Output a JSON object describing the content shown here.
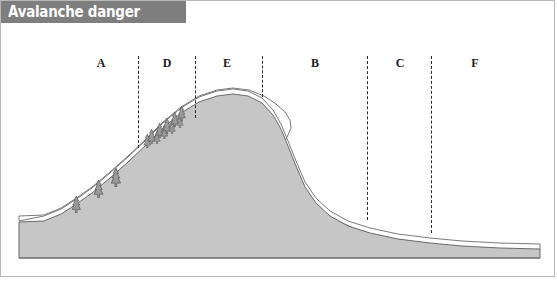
{
  "figure": {
    "title": "Avalanche danger",
    "title_bar_color": "#7e7e7e",
    "title_text_color": "#ffffff",
    "background_color": "#ffffff",
    "frame_color": "#b8b8b8"
  },
  "terrain": {
    "rock_fill_color": "#c6c6c6",
    "rock_outline_color": "#6b6b6b",
    "snow_fill_color": "#ffffff",
    "snow_outline_color": "#7a7a7a",
    "description": "Cross-section of a mountain ridge with a snow cover layer and a cornice on the lee slope"
  },
  "zones": [
    {
      "label": "A",
      "x": 101,
      "y": 57
    },
    {
      "label": "D",
      "x": 167,
      "y": 57
    },
    {
      "label": "E",
      "x": 227,
      "y": 57
    },
    {
      "label": "B",
      "x": 315,
      "y": 57
    },
    {
      "label": "C",
      "x": 400,
      "y": 57
    },
    {
      "label": "F",
      "x": 475,
      "y": 57
    }
  ],
  "dividers": [
    {
      "x": 138,
      "top": 56,
      "bottom": 148
    },
    {
      "x": 195,
      "top": 56,
      "bottom": 118
    },
    {
      "x": 262,
      "top": 56,
      "bottom": 97
    },
    {
      "x": 367,
      "top": 56,
      "bottom": 220
    },
    {
      "x": 431,
      "top": 56,
      "bottom": 233
    }
  ],
  "trees": [
    {
      "x": 76,
      "y": 196,
      "size": 17
    },
    {
      "x": 99,
      "y": 180,
      "size": 18
    },
    {
      "x": 116,
      "y": 168,
      "size": 19
    },
    {
      "x": 147,
      "y": 134,
      "size": 14
    },
    {
      "x": 152,
      "y": 129,
      "size": 15
    },
    {
      "x": 157,
      "y": 130,
      "size": 13
    },
    {
      "x": 160,
      "y": 123,
      "size": 15
    },
    {
      "x": 164,
      "y": 125,
      "size": 14
    },
    {
      "x": 167,
      "y": 118,
      "size": 16
    },
    {
      "x": 172,
      "y": 120,
      "size": 13
    },
    {
      "x": 175,
      "y": 112,
      "size": 15
    },
    {
      "x": 180,
      "y": 114,
      "size": 13
    },
    {
      "x": 182,
      "y": 106,
      "size": 15
    }
  ],
  "geometry": {
    "rock_path": "M 19,258 L 19,222 L 44,221 L 61,214 L 75,205 L 92,193 L 110,178 L 128,162 L 146,145 L 163,128 L 181,113 L 199,102 L 217,96 L 233,94 L 248,96 L 262,103 L 273,115 L 281,129 L 288,146 L 296,166 L 305,187 L 316,203 L 330,216 L 348,226 L 370,233 L 398,239 L 430,243 L 462,246 L 500,248 L 540,249 L 540,258 Z",
    "snow_path": "M 19,221 L 19,216 L 44,215 L 61,208 L 75,199 L 92,187 L 110,172 L 128,156 L 146,139 L 163,122 L 181,107 L 199,96 L 217,90 L 233,88 L 249,90 L 264,96 L 276,104 L 285,112 L 290,120 L 291,128 L 288,135 L 285,141 L 286,150 L 291,162 L 299,179 L 308,195 L 319,208 L 334,219 L 353,228 L 375,235 L 400,240 L 432,244 L 465,247 L 502,249 L 540,250 L 540,244 L 500,243 L 462,241 L 430,238 L 398,234 L 370,228 L 348,221 L 330,211 L 316,198 L 305,182 L 296,161 L 288,141 L 281,124 L 273,110 L 262,98 L 248,91 L 233,89 L 217,91 L 199,97 L 181,108 L 163,123 L 146,140 L 128,157 L 110,173 L 92,188 L 75,200 L 61,209 L 44,216 Z",
    "baseline_y": 258,
    "terrain_left_x": 19,
    "terrain_right_x": 540
  }
}
